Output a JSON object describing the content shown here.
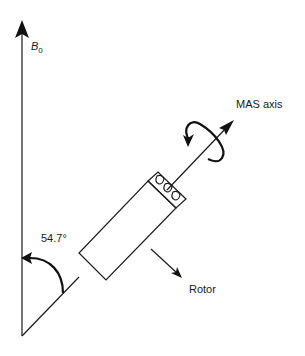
{
  "diagram": {
    "type": "magic-angle-spinning-schematic",
    "labels": {
      "field": "B",
      "field_subscript": "0",
      "axis": "MAS axis",
      "angle": "54.7°",
      "rotor": "Rotor"
    },
    "colors": {
      "stroke": "#1a1a1a",
      "background": "#ffffff"
    }
  }
}
